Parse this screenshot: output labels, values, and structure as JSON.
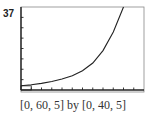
{
  "chart_data": {
    "type": "line",
    "title": "",
    "xlabel": "",
    "ylabel": "",
    "y_marker_label": "37",
    "window": {
      "xmin": 0,
      "xmax": 60,
      "xscl": 5,
      "ymin": 0,
      "ymax": 40,
      "yscl": 5
    },
    "xlim": [
      0,
      60
    ],
    "ylim": [
      0,
      40
    ],
    "grid": false,
    "legend": null,
    "caption": "[0, 60, 5] by [0, 40, 5]",
    "series": [
      {
        "name": "exponential curve",
        "x": [
          0,
          5,
          10,
          15,
          20,
          25,
          30,
          35,
          40,
          45,
          50
        ],
        "y": [
          2,
          2.5,
          3.2,
          4.1,
          5.3,
          6.9,
          9.3,
          13,
          19,
          28,
          40
        ]
      }
    ]
  },
  "labels": {
    "y_marker": "37",
    "caption": "[0, 60, 5] by [0, 40, 5]"
  }
}
